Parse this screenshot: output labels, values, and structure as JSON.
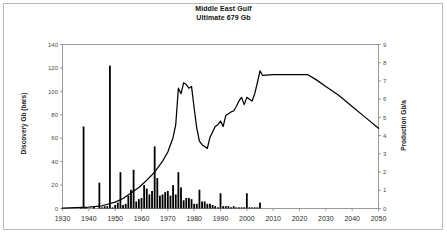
{
  "figure": {
    "width": 447,
    "height": 234,
    "background": "#ffffff",
    "frame_color": "#b9b9b9"
  },
  "title": {
    "line1": "Middle East Gulf",
    "line2": "Ultimate  679 Gb"
  },
  "chart_data": {
    "type": "bar",
    "subtitle": "Ultimate  679 Gb",
    "xlabel": "",
    "ylabel": "Discovery Gb (bars)",
    "y2label": "Production Gb/a",
    "xlim": [
      1930,
      2050
    ],
    "ylim": [
      0,
      140
    ],
    "y2lim": [
      0,
      9
    ],
    "xticks": [
      1930,
      1940,
      1950,
      1960,
      1970,
      1980,
      1990,
      2000,
      2010,
      2020,
      2030,
      2040,
      2050
    ],
    "yticks": [
      0,
      20,
      40,
      60,
      80,
      100,
      120,
      140
    ],
    "y2ticks": [
      0,
      1,
      2,
      3,
      4,
      5,
      6,
      7,
      8,
      9
    ],
    "grid": false,
    "legend": "none",
    "series": [
      {
        "name": "Discovery Gb (bars)",
        "type": "bar",
        "axis": "left",
        "color": "#000000",
        "x": [
          1930,
          1931,
          1932,
          1933,
          1934,
          1935,
          1936,
          1937,
          1938,
          1939,
          1940,
          1941,
          1942,
          1943,
          1944,
          1945,
          1946,
          1947,
          1948,
          1949,
          1950,
          1951,
          1952,
          1953,
          1954,
          1955,
          1956,
          1957,
          1958,
          1959,
          1960,
          1961,
          1962,
          1963,
          1964,
          1965,
          1966,
          1967,
          1968,
          1969,
          1970,
          1971,
          1972,
          1973,
          1974,
          1975,
          1976,
          1977,
          1978,
          1979,
          1980,
          1981,
          1982,
          1983,
          1984,
          1985,
          1986,
          1987,
          1988,
          1989,
          1990,
          1991,
          1992,
          1993,
          1994,
          1995,
          1996,
          1997,
          1998,
          1999,
          2000,
          2001,
          2002,
          2003,
          2004,
          2005,
          2006,
          2007,
          2008,
          2009,
          2010
        ],
        "values": [
          0,
          0,
          0,
          0,
          0,
          0,
          0,
          1,
          70,
          1,
          0,
          0,
          2,
          0,
          22,
          1,
          2,
          2,
          122,
          1,
          3,
          5,
          31,
          3,
          4,
          11,
          16,
          33,
          6,
          8,
          9,
          20,
          17,
          12,
          15,
          53,
          26,
          11,
          12,
          14,
          15,
          11,
          20,
          12,
          31,
          18,
          7,
          9,
          9,
          8,
          4,
          4,
          16,
          6,
          6,
          4,
          4,
          3,
          2,
          1,
          13,
          2,
          2,
          2,
          1,
          2,
          1,
          1,
          1,
          1,
          13,
          1,
          1,
          1,
          1,
          5,
          0,
          0,
          0,
          0,
          0
        ]
      },
      {
        "name": "Production Gb/a",
        "type": "line",
        "axis": "right",
        "color": "#000000",
        "x": [
          1930,
          1935,
          1940,
          1945,
          1950,
          1953,
          1956,
          1959,
          1962,
          1965,
          1968,
          1970,
          1972,
          1973,
          1974,
          1975,
          1976,
          1977,
          1978,
          1979,
          1980,
          1981,
          1982,
          1983,
          1984,
          1985,
          1986,
          1987,
          1988,
          1989,
          1990,
          1991,
          1992,
          1993,
          1994,
          1995,
          1996,
          1997,
          1998,
          1999,
          2000,
          2001,
          2002,
          2003,
          2004,
          2005,
          2006,
          2010,
          2015,
          2020,
          2023,
          2026,
          2030,
          2035,
          2040,
          2045,
          2050
        ],
        "values": [
          0.02,
          0.05,
          0.08,
          0.15,
          0.35,
          0.55,
          0.85,
          1.15,
          1.55,
          2.0,
          2.6,
          3.1,
          3.9,
          4.6,
          6.6,
          6.3,
          6.9,
          6.8,
          6.6,
          6.7,
          5.5,
          4.4,
          3.7,
          3.5,
          3.4,
          3.3,
          3.9,
          4.2,
          4.5,
          4.6,
          4.8,
          4.5,
          5.1,
          5.2,
          5.3,
          5.35,
          5.6,
          5.9,
          6.1,
          5.7,
          6.1,
          6.0,
          5.9,
          6.3,
          6.9,
          7.55,
          7.3,
          7.35,
          7.35,
          7.35,
          7.35,
          7.1,
          6.7,
          6.2,
          5.6,
          5.0,
          4.4
        ]
      }
    ]
  },
  "axes": {
    "left": {
      "label": "Discovery Gb (bars)",
      "ticks": [
        "0",
        "20",
        "40",
        "60",
        "80",
        "100",
        "120",
        "140"
      ]
    },
    "right": {
      "label": "Production Gb/a",
      "ticks": [
        "0",
        "1",
        "2",
        "3",
        "4",
        "5",
        "6",
        "7",
        "8",
        "9"
      ]
    },
    "bottom": {
      "ticks": [
        "1930",
        "1940",
        "1950",
        "1960",
        "1970",
        "1980",
        "1990",
        "2000",
        "2010",
        "2020",
        "2030",
        "2040",
        "2050"
      ]
    }
  }
}
